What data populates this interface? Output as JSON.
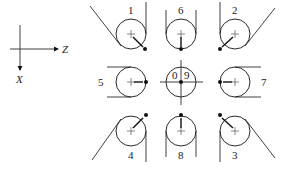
{
  "axes": {
    "horizontal_label": "Z",
    "vertical_label": "X"
  },
  "positions": [
    {
      "id": "1",
      "label": "1",
      "cx": 131,
      "cy": 34,
      "dot": [
        144,
        49
      ],
      "style": "top-left"
    },
    {
      "id": "6",
      "label": "6",
      "cx": 181,
      "cy": 34,
      "dot": [
        181,
        49
      ],
      "style": "top-center"
    },
    {
      "id": "2",
      "label": "2",
      "cx": 235,
      "cy": 34,
      "dot": [
        219,
        49
      ],
      "style": "top-right"
    },
    {
      "id": "5",
      "label": "5",
      "cx": 131,
      "cy": 82,
      "dot": [
        146,
        82
      ],
      "style": "middle-left"
    },
    {
      "id": "09",
      "label": "0 9",
      "label_left": "0",
      "label_right": "9",
      "cx": 181,
      "cy": 82,
      "dot": [
        181,
        82
      ],
      "style": "center"
    },
    {
      "id": "7",
      "label": "7",
      "cx": 235,
      "cy": 82,
      "dot": [
        220,
        82
      ],
      "style": "middle-right"
    },
    {
      "id": "4",
      "label": "4",
      "cx": 131,
      "cy": 131,
      "dot": [
        146,
        115
      ],
      "style": "bottom-left"
    },
    {
      "id": "8",
      "label": "8",
      "cx": 181,
      "cy": 131,
      "dot": [
        181,
        115
      ],
      "style": "bottom-center"
    },
    {
      "id": "3",
      "label": "3",
      "cx": 235,
      "cy": 131,
      "dot": [
        219,
        115
      ],
      "style": "bottom-right"
    }
  ],
  "labels": {
    "p1": "1",
    "p2": "2",
    "p3": "3",
    "p4": "4",
    "p5": "5",
    "p6": "6",
    "p7": "7",
    "p8": "8",
    "p0": "0",
    "p9": "9"
  }
}
